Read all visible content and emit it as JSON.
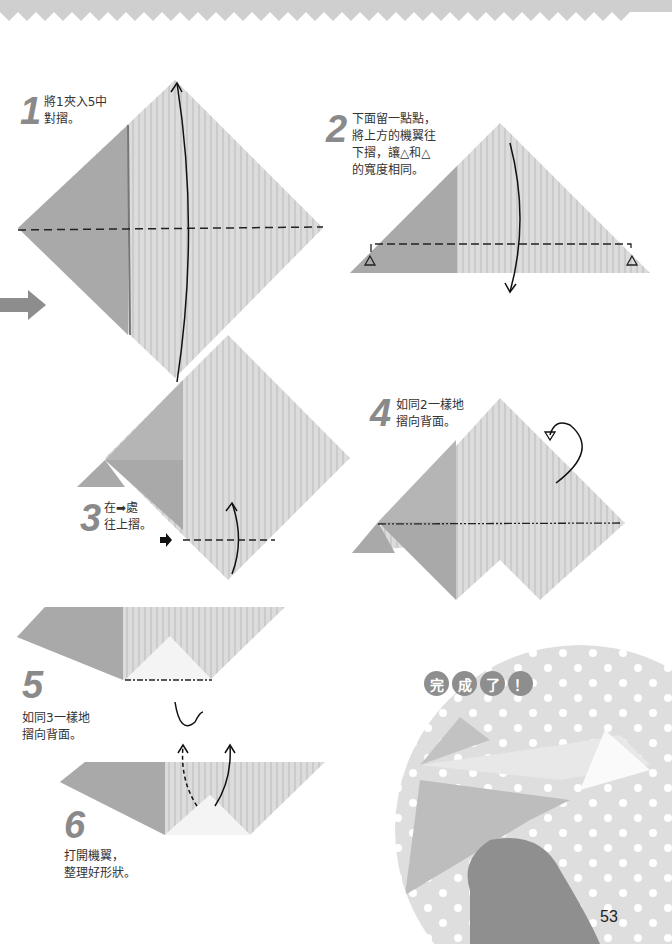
{
  "page": {
    "number": "53"
  },
  "colors": {
    "paper_dark": "#a9a9a9",
    "paper_light": "#d8d8d8",
    "header_band": "#cfcfcf",
    "step_number": "#8a8a8a",
    "circle_bg": "#dcdcdc"
  },
  "steps": [
    {
      "number": "1",
      "text": "將1夾入5中\n對摺。"
    },
    {
      "number": "2",
      "text": "下面留一點點，\n將上方的機翼往\n下摺，讓△和△\n的寬度相同。"
    },
    {
      "number": "3",
      "text": "在➡處\n往上摺。"
    },
    {
      "number": "4",
      "text": "如同2一樣地\n摺向背面。"
    },
    {
      "number": "5",
      "text": "如同3一樣地\n摺向背面。"
    },
    {
      "number": "6",
      "text": "打開機翼，\n整理好形狀。"
    }
  ],
  "completion": {
    "badges": [
      "完",
      "成",
      "了",
      "！"
    ]
  }
}
